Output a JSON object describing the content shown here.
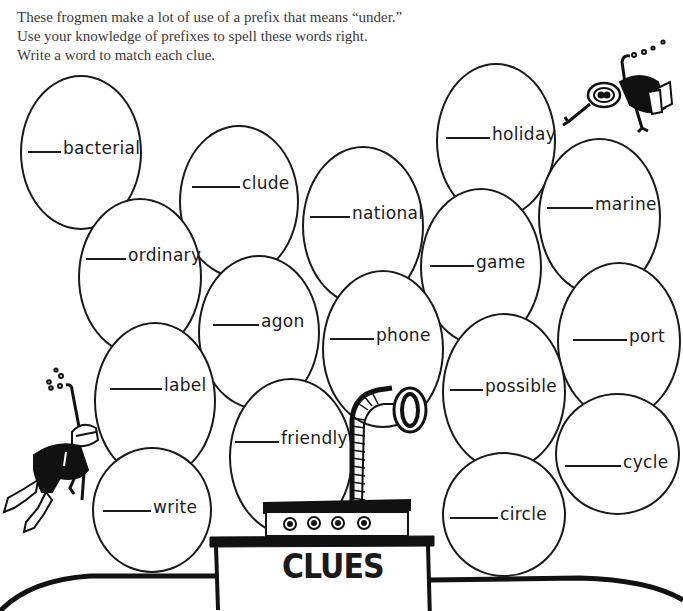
{
  "instructions": {
    "line1": "These frogmen make a lot of use of a prefix that means “under.”",
    "line2": "Use your knowledge of prefixes to spell these words right.",
    "line3": "Write a word to match each clue."
  },
  "bubbles": [
    {
      "id": "bacterial",
      "blank": "____",
      "word": "bacterial"
    },
    {
      "id": "clude",
      "blank": "____",
      "word": "clude"
    },
    {
      "id": "ordinary",
      "blank": "____",
      "word": "ordinary"
    },
    {
      "id": "national",
      "blank": "____",
      "word": "national"
    },
    {
      "id": "holiday",
      "blank": "____",
      "word": "holiday"
    },
    {
      "id": "marine",
      "blank": "____",
      "word": "marine"
    },
    {
      "id": "game",
      "blank": "____",
      "word": "game"
    },
    {
      "id": "agon",
      "blank": "____",
      "word": "agon"
    },
    {
      "id": "phone",
      "blank": "____",
      "word": "phone"
    },
    {
      "id": "port",
      "blank": "____",
      "word": "port"
    },
    {
      "id": "label",
      "blank": "____",
      "word": "label"
    },
    {
      "id": "possible",
      "blank": "____",
      "word": "possible"
    },
    {
      "id": "friendly",
      "blank": "____",
      "word": "friendly"
    },
    {
      "id": "cycle",
      "blank": "____",
      "word": "cycle"
    },
    {
      "id": "write",
      "blank": "____",
      "word": "write"
    },
    {
      "id": "circle",
      "blank": "____",
      "word": "circle"
    }
  ],
  "clues_section": {
    "title": "CLUES"
  },
  "illustrations": {
    "diver_top_right": "frogman-diver",
    "diver_left": "frogman-diver",
    "submarine": "submarine-periscope"
  }
}
